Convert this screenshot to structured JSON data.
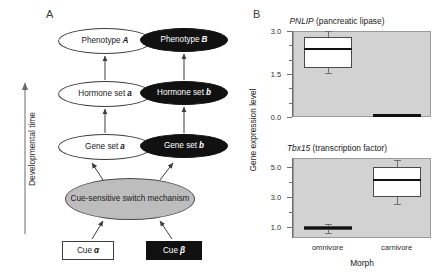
{
  "figure": {
    "panel_a": {
      "label": "A",
      "axis": {
        "label": "Developmental time",
        "direction": "up"
      },
      "nodes": [
        {
          "id": "phenotype-a",
          "text": "Phenotype ",
          "emph": "A",
          "shape": "ellipse",
          "fill": "white"
        },
        {
          "id": "phenotype-b",
          "text": "Phenotype ",
          "emph": "B",
          "shape": "ellipse",
          "fill": "black"
        },
        {
          "id": "hormone-a",
          "text": "Hormone set ",
          "emph": "a",
          "shape": "ellipse",
          "fill": "white"
        },
        {
          "id": "hormone-b",
          "text": "Hormone set ",
          "emph": "b",
          "shape": "ellipse",
          "fill": "black"
        },
        {
          "id": "gene-a",
          "text": "Gene set ",
          "emph": "a",
          "shape": "ellipse",
          "fill": "white"
        },
        {
          "id": "gene-b",
          "text": "Gene set ",
          "emph": "b",
          "shape": "ellipse",
          "fill": "black"
        },
        {
          "id": "switch",
          "text": "Cue-sensitive switch mechanism",
          "emph": "",
          "shape": "ellipse",
          "fill": "gray"
        },
        {
          "id": "cue-a",
          "text": "Cue ",
          "emph": "α",
          "shape": "box",
          "fill": "white"
        },
        {
          "id": "cue-b",
          "text": "Cue ",
          "emph": "β",
          "shape": "box",
          "fill": "black"
        }
      ]
    },
    "panel_b": {
      "label": "B",
      "yaxis_title": "Gene expression level",
      "xaxis_title": "Morph"
    }
  },
  "chart_data": [
    {
      "type": "box",
      "id": "pnlip",
      "title_italic": "PNLIP",
      "title_rest": " (pancreatic lipase)",
      "xlabel": "Morph",
      "ylabel": "Gene expression level",
      "categories": [
        "omnivore",
        "carnivore"
      ],
      "ylim": [
        0.0,
        3.0
      ],
      "yticks_major": [
        0.0,
        1.5,
        3.0
      ],
      "ytick_labels": [
        "0.0",
        "1.5",
        "3.0"
      ],
      "yticks_minor": [
        0.5,
        1.0,
        2.0,
        2.5
      ],
      "grid": false,
      "boxes": [
        {
          "category": "omnivore",
          "whisker_low": 1.52,
          "q1": 1.72,
          "median": 2.38,
          "q3": 2.8,
          "whisker_high": 3.0
        },
        {
          "category": "carnivore",
          "whisker_low": 0.05,
          "q1": 0.05,
          "median": 0.05,
          "q3": 0.05,
          "whisker_high": 0.05
        }
      ]
    },
    {
      "type": "box",
      "id": "tbx15",
      "title_italic": "Tbx15",
      "title_rest": " (transcription factor)",
      "xlabel": "Morph",
      "ylabel": "Gene expression level",
      "categories": [
        "omnivore",
        "carnivore"
      ],
      "ylim": [
        0.3,
        5.6
      ],
      "yticks_major": [
        1.0,
        3.0,
        5.0
      ],
      "ytick_labels": [
        "1.0",
        "3.0",
        "5.0"
      ],
      "yticks_minor": [
        2.0,
        4.0
      ],
      "grid": false,
      "boxes": [
        {
          "category": "omnivore",
          "whisker_low": 0.62,
          "q1": 0.8,
          "median": 0.95,
          "q3": 1.1,
          "whisker_high": 1.25
        },
        {
          "category": "carnivore",
          "whisker_low": 2.55,
          "q1": 3.02,
          "median": 4.12,
          "q3": 5.0,
          "whisker_high": 5.45
        }
      ]
    }
  ]
}
